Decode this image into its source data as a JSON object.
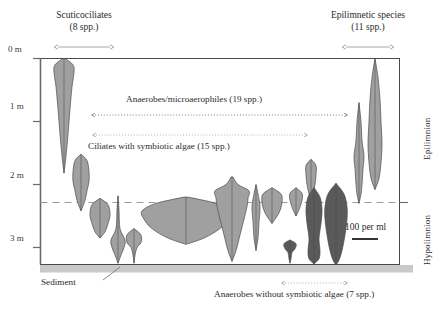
{
  "figure": {
    "type": "depth-profile-violin"
  },
  "axis": {
    "unit": "m",
    "ticks": [
      {
        "label": "0 m",
        "depth_m": 0
      },
      {
        "label": "1 m",
        "depth_m": 1
      },
      {
        "label": "2 m",
        "depth_m": 2
      },
      {
        "label": "3 m",
        "depth_m": 3
      }
    ],
    "depth_range_m": [
      0,
      3.3
    ]
  },
  "groups": {
    "scuticociliates": {
      "name": "Scuticociliates",
      "count": "(8 spp.)"
    },
    "epilimnetic": {
      "name": "Epilimnetic species",
      "count": "(11 spp.)"
    },
    "anaerobes_microaerophiles": {
      "label": "Anaerobes/microaerophiles (19 spp.)"
    },
    "ciliates_symbiotic": {
      "label": "Ciliates with symbiotic algae (15 spp.)"
    },
    "anaerobes_no_symbiotic": {
      "label": "Anaerobes without symbiotic algae (7 spp.)"
    }
  },
  "strata": {
    "epilimnion": "Epilimnion",
    "hypolimnion": "Hypolimnion",
    "thermocline_depth_m": 2.3
  },
  "sediment": {
    "label": "Sediment",
    "top_depth_m": 3.28
  },
  "scale_bar": {
    "label": "100 per ml"
  },
  "colors": {
    "fill_light": "#a0a0a0",
    "fill_dark": "#5a5a5a",
    "outline": "#4a4a4a",
    "axis": "#555555",
    "thermocline": "#9a9a9a",
    "sediment": "#c9c9c9",
    "arrow_gray": "#8d8d8d",
    "text": "#2b2b2b"
  },
  "chart_data": {
    "type": "area",
    "title": "",
    "xlabel": "",
    "ylabel": "Depth (m)",
    "ylim": [
      0,
      3.3
    ],
    "grid": false,
    "legend": [
      "light gray = aerobic/symbiotic taxa",
      "dark gray = anaerobes without symbiotic algae"
    ],
    "annotations": [
      "Scuticociliates (8 spp.)",
      "Epilimnetic species (11 spp.)",
      "Anaerobes/microaerophiles (19 spp.)",
      "Ciliates with symbiotic algae (15 spp.)",
      "Anaerobes without symbiotic algae (7 spp.)",
      "Sediment",
      "100 per ml",
      "Epilimnion",
      "Hypolimnion"
    ],
    "species_profiles": [
      {
        "id": "sp01",
        "group": "scuticociliates",
        "shade": "light",
        "x_center": 64,
        "peak_depth_m": 0.15,
        "extent_m": [
          0.0,
          1.82
        ],
        "half_widths": [
          [
            0.0,
            1
          ],
          [
            0.1,
            9
          ],
          [
            0.22,
            10
          ],
          [
            0.45,
            8
          ],
          [
            0.8,
            6
          ],
          [
            1.2,
            4
          ],
          [
            1.55,
            2
          ],
          [
            1.82,
            0
          ]
        ]
      },
      {
        "id": "sp02",
        "group": "scuticociliates",
        "shade": "light",
        "x_center": 81,
        "peak_depth_m": 1.85,
        "extent_m": [
          1.52,
          2.42
        ],
        "half_widths": [
          [
            1.52,
            0
          ],
          [
            1.62,
            6
          ],
          [
            1.8,
            8
          ],
          [
            1.95,
            8
          ],
          [
            2.1,
            6
          ],
          [
            2.25,
            4
          ],
          [
            2.42,
            0
          ]
        ]
      },
      {
        "id": "sp03",
        "group": "scuticociliates",
        "shade": "light",
        "x_center": 100,
        "peak_depth_m": 2.45,
        "extent_m": [
          2.22,
          2.85
        ],
        "half_widths": [
          [
            2.22,
            0
          ],
          [
            2.32,
            8
          ],
          [
            2.48,
            10
          ],
          [
            2.62,
            8
          ],
          [
            2.75,
            5
          ],
          [
            2.85,
            0
          ]
        ]
      },
      {
        "id": "sp04",
        "group": "anaerobes_microaerophiles",
        "shade": "light",
        "x_center": 118,
        "peak_depth_m": 2.95,
        "extent_m": [
          2.18,
          3.25
        ],
        "half_widths": [
          [
            2.18,
            0
          ],
          [
            2.4,
            1
          ],
          [
            2.7,
            2
          ],
          [
            2.88,
            7
          ],
          [
            3.0,
            6
          ],
          [
            3.12,
            3
          ],
          [
            3.25,
            0
          ]
        ]
      },
      {
        "id": "sp05",
        "group": "anaerobes_microaerophiles",
        "shade": "light",
        "x_center": 134,
        "peak_depth_m": 2.85,
        "extent_m": [
          2.7,
          3.25
        ],
        "half_widths": [
          [
            2.7,
            0
          ],
          [
            2.8,
            7
          ],
          [
            2.92,
            7
          ],
          [
            3.0,
            3
          ],
          [
            3.12,
            1
          ],
          [
            3.25,
            0
          ]
        ]
      },
      {
        "id": "sp06",
        "group": "ciliates_symbiotic",
        "shade": "light",
        "x_center": 186,
        "peak_depth_m": 2.35,
        "extent_m": [
          2.2,
          2.95
        ],
        "half_widths": [
          [
            2.2,
            2
          ],
          [
            2.3,
            30
          ],
          [
            2.42,
            44
          ],
          [
            2.55,
            42
          ],
          [
            2.7,
            34
          ],
          [
            2.85,
            18
          ],
          [
            2.95,
            0
          ]
        ]
      },
      {
        "id": "sp07",
        "group": "ciliates_symbiotic",
        "shade": "light",
        "x_center": 232,
        "peak_depth_m": 2.12,
        "extent_m": [
          1.88,
          3.22
        ],
        "half_widths": [
          [
            1.88,
            1
          ],
          [
            2.0,
            6
          ],
          [
            2.1,
            17
          ],
          [
            2.22,
            16
          ],
          [
            2.35,
            15
          ],
          [
            2.55,
            12
          ],
          [
            2.8,
            8
          ],
          [
            3.05,
            4
          ],
          [
            3.22,
            0
          ]
        ]
      },
      {
        "id": "sp08",
        "group": "ciliates_symbiotic",
        "shade": "light",
        "x_center": 256,
        "peak_depth_m": 2.35,
        "extent_m": [
          2.0,
          3.05
        ],
        "half_widths": [
          [
            2.0,
            0
          ],
          [
            2.15,
            2
          ],
          [
            2.35,
            4
          ],
          [
            2.6,
            3
          ],
          [
            2.85,
            2
          ],
          [
            3.05,
            0
          ]
        ]
      },
      {
        "id": "sp09",
        "group": "ciliates_symbiotic",
        "shade": "light",
        "x_center": 272,
        "peak_depth_m": 2.25,
        "extent_m": [
          2.05,
          2.62
        ],
        "half_widths": [
          [
            2.05,
            0
          ],
          [
            2.15,
            9
          ],
          [
            2.28,
            10
          ],
          [
            2.45,
            7
          ],
          [
            2.62,
            0
          ]
        ]
      },
      {
        "id": "sp10",
        "group": "ciliates_symbiotic",
        "shade": "light",
        "x_center": 296,
        "peak_depth_m": 2.2,
        "extent_m": [
          2.05,
          2.5
        ],
        "half_widths": [
          [
            2.05,
            0
          ],
          [
            2.14,
            6
          ],
          [
            2.25,
            6
          ],
          [
            2.4,
            3
          ],
          [
            2.5,
            0
          ]
        ]
      },
      {
        "id": "sp11",
        "group": "anaerobes_no_symbiotic",
        "shade": "dark",
        "x_center": 290,
        "peak_depth_m": 2.98,
        "extent_m": [
          2.88,
          3.25
        ],
        "half_widths": [
          [
            2.88,
            0
          ],
          [
            2.94,
            6
          ],
          [
            3.02,
            5
          ],
          [
            3.08,
            2
          ],
          [
            3.18,
            1
          ],
          [
            3.25,
            0
          ]
        ]
      },
      {
        "id": "sp12",
        "group": "ciliates_symbiotic",
        "shade": "light",
        "x_center": 311,
        "peak_depth_m": 1.72,
        "extent_m": [
          1.6,
          2.28
        ],
        "half_widths": [
          [
            1.6,
            0
          ],
          [
            1.7,
            5
          ],
          [
            1.85,
            5
          ],
          [
            2.0,
            4
          ],
          [
            2.15,
            2
          ],
          [
            2.28,
            0
          ]
        ]
      },
      {
        "id": "sp13",
        "group": "anaerobes_no_symbiotic",
        "shade": "dark",
        "x_center": 314,
        "peak_depth_m": 2.4,
        "extent_m": [
          2.05,
          3.26
        ],
        "half_widths": [
          [
            2.05,
            0
          ],
          [
            2.2,
            6
          ],
          [
            2.4,
            8
          ],
          [
            2.62,
            7
          ],
          [
            2.85,
            5
          ],
          [
            3.05,
            6
          ],
          [
            3.18,
            5
          ],
          [
            3.26,
            0
          ]
        ]
      },
      {
        "id": "sp14",
        "group": "anaerobes_no_symbiotic",
        "shade": "dark",
        "x_center": 336,
        "peak_depth_m": 2.45,
        "extent_m": [
          1.98,
          3.28
        ],
        "half_widths": [
          [
            1.98,
            0
          ],
          [
            2.15,
            8
          ],
          [
            2.35,
            11
          ],
          [
            2.55,
            11
          ],
          [
            2.8,
            9
          ],
          [
            3.05,
            6
          ],
          [
            3.2,
            3
          ],
          [
            3.28,
            0
          ]
        ]
      },
      {
        "id": "sp15",
        "group": "epilimnetic",
        "shade": "light",
        "x_center": 359,
        "peak_depth_m": 1.55,
        "extent_m": [
          0.7,
          2.3
        ],
        "half_widths": [
          [
            0.7,
            0
          ],
          [
            1.0,
            2
          ],
          [
            1.3,
            3
          ],
          [
            1.55,
            5
          ],
          [
            1.75,
            4
          ],
          [
            2.0,
            3
          ],
          [
            2.15,
            2
          ],
          [
            2.3,
            0
          ]
        ]
      },
      {
        "id": "sp16",
        "group": "epilimnetic",
        "shade": "light",
        "x_center": 375,
        "peak_depth_m": 1.45,
        "extent_m": [
          0.0,
          2.08
        ],
        "half_widths": [
          [
            0.0,
            0
          ],
          [
            0.3,
            3
          ],
          [
            0.65,
            5
          ],
          [
            1.0,
            6
          ],
          [
            1.35,
            7
          ],
          [
            1.65,
            6
          ],
          [
            1.9,
            4
          ],
          [
            2.08,
            0
          ]
        ]
      }
    ]
  }
}
